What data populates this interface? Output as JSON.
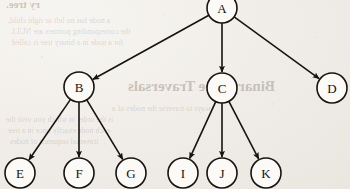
{
  "page": {
    "background_color": "#f1eee9",
    "ink_color": "#161310",
    "media": "scanned-book-page"
  },
  "figure": {
    "type": "tree-diagram",
    "node_radius": 15,
    "edge_style": "straight-line-with-solid-arrowhead",
    "arrow_direction": "parent-to-child",
    "nodes": [
      {
        "id": "A",
        "label": "A",
        "cx": 222,
        "cy": 8,
        "level": 0,
        "clipped_top": true
      },
      {
        "id": "B",
        "label": "B",
        "cx": 79,
        "cy": 87,
        "level": 1,
        "clipped_top": false
      },
      {
        "id": "C",
        "label": "C",
        "cx": 222,
        "cy": 88,
        "level": 1,
        "clipped_top": false
      },
      {
        "id": "D",
        "label": "D",
        "cx": 332,
        "cy": 88,
        "level": 1,
        "clipped_top": false
      },
      {
        "id": "E",
        "label": "E",
        "cx": 20,
        "cy": 173,
        "level": 2,
        "clipped_top": false
      },
      {
        "id": "F",
        "label": "F",
        "cx": 79,
        "cy": 173,
        "level": 2,
        "clipped_top": false
      },
      {
        "id": "G",
        "label": "G",
        "cx": 131,
        "cy": 173,
        "level": 2,
        "clipped_top": false
      },
      {
        "id": "I",
        "label": "I",
        "cx": 183,
        "cy": 173,
        "level": 2,
        "clipped_top": false
      },
      {
        "id": "J",
        "label": "J",
        "cx": 222,
        "cy": 173,
        "level": 2,
        "clipped_top": false
      },
      {
        "id": "K",
        "label": "K",
        "cx": 266,
        "cy": 173,
        "level": 2,
        "clipped_top": false
      }
    ],
    "edges": [
      {
        "from": "A",
        "to": "B"
      },
      {
        "from": "A",
        "to": "C"
      },
      {
        "from": "A",
        "to": "D"
      },
      {
        "from": "B",
        "to": "E"
      },
      {
        "from": "B",
        "to": "F"
      },
      {
        "from": "B",
        "to": "G"
      },
      {
        "from": "C",
        "to": "I"
      },
      {
        "from": "C",
        "to": "J"
      },
      {
        "from": "C",
        "to": "K"
      }
    ]
  },
  "showthrough": {
    "note": "faint mirrored text bleeding through from the reverse side of the paper",
    "items": [
      {
        "text": "ry tree.",
        "x": 6,
        "y": -2,
        "size": 11,
        "kind": "heading"
      },
      {
        "text": "a node has no left or right child,",
        "x": 8,
        "y": 16,
        "size": 8,
        "kind": "tiny"
      },
      {
        "text": "the corresponding pointers are NULL",
        "x": 10,
        "y": 27,
        "size": 8,
        "kind": "tiny"
      },
      {
        "text": "for a node in a binary tree is called",
        "x": 12,
        "y": 38,
        "size": 8,
        "kind": "tiny"
      },
      {
        "text": "Binary Tree Traversals",
        "x": 128,
        "y": 78,
        "size": 15,
        "kind": "heading"
      },
      {
        "text": "ways to traverse the nodes of a",
        "x": 112,
        "y": 104,
        "size": 8,
        "kind": "tiny"
      },
      {
        "text": "is the order in which you visit the",
        "x": 6,
        "y": 115,
        "size": 8,
        "kind": "tiny"
      },
      {
        "text": "each node exactly once in a tree",
        "x": 8,
        "y": 126,
        "size": 8,
        "kind": "tiny"
      },
      {
        "text": "traversal sequence of nodes",
        "x": 10,
        "y": 137,
        "size": 8,
        "kind": "tiny"
      }
    ]
  }
}
